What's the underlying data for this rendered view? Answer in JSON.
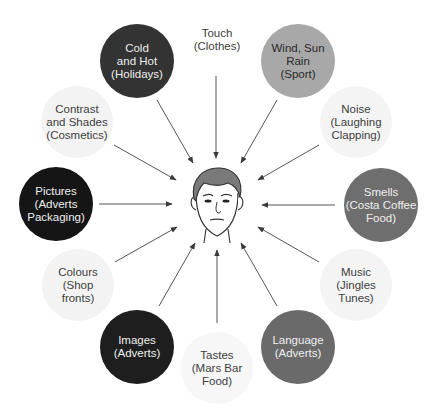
{
  "diagram": {
    "center": {
      "label": "Person (face)",
      "x": 217,
      "y": 203
    },
    "colors": {
      "dark": "#2f2f2f",
      "black": "#1a1a1a",
      "mid": "#6a6a6a",
      "light_mid": "#a8a8a8",
      "pale": "#f2f2f2",
      "text_dark_bg": "#f0f0f0",
      "text_light_bg": "#404040",
      "arrow": "#4a4a4a"
    },
    "nodes": [
      {
        "id": "touch",
        "label": "Touch\n(Clothes)",
        "cx": 217,
        "cy": 40,
        "r": 36,
        "fill": "#ffffff",
        "text": "#404040",
        "arrow": [
          216,
          73,
          216,
          158
        ]
      },
      {
        "id": "wind",
        "label": "Wind, Sun\nRain\n(Sport)",
        "cx": 298,
        "cy": 61,
        "r": 37,
        "fill": "#a8a8a8",
        "text": "#2a2a2a",
        "arrow": [
          277,
          100,
          241,
          163
        ]
      },
      {
        "id": "noise",
        "label": "Noise\n(Laughing\nClapping)",
        "cx": 356,
        "cy": 122,
        "r": 36,
        "fill": "#f4f4f4",
        "text": "#404040",
        "arrow": [
          319,
          145,
          258,
          180
        ]
      },
      {
        "id": "smells",
        "label": "Smells\n(Costa Coffee\nFood)",
        "cx": 381,
        "cy": 205,
        "r": 37,
        "fill": "#6e6e6e",
        "text": "#eeeeee",
        "arrow": [
          335,
          205,
          262,
          205
        ]
      },
      {
        "id": "music",
        "label": "Music\n(Jingles\nTunes)",
        "cx": 356,
        "cy": 285,
        "r": 36,
        "fill": "#f4f4f4",
        "text": "#404040",
        "arrow": [
          319,
          262,
          258,
          227
        ]
      },
      {
        "id": "language",
        "label": "Language\n(Adverts)",
        "cx": 298,
        "cy": 347,
        "r": 37,
        "fill": "#6a6a6a",
        "text": "#eeeeee",
        "arrow": [
          277,
          306,
          241,
          243
        ]
      },
      {
        "id": "tastes",
        "label": "Tastes\n(Mars Bar\nFood)",
        "cx": 217,
        "cy": 368,
        "r": 36,
        "fill": "#f7f7f7",
        "text": "#404040",
        "arrow": [
          217,
          323,
          217,
          250
        ]
      },
      {
        "id": "images",
        "label": "Images\n(Adverts)",
        "cx": 137,
        "cy": 347,
        "r": 37,
        "fill": "#1e1e1e",
        "text": "#eeeeee",
        "arrow": [
          159,
          306,
          195,
          243
        ]
      },
      {
        "id": "colours",
        "label": "Colours\n(Shop\nfronts)",
        "cx": 78,
        "cy": 285,
        "r": 36,
        "fill": "#f3f3f3",
        "text": "#404040",
        "arrow": [
          115,
          262,
          177,
          227
        ]
      },
      {
        "id": "pictures",
        "label": "Pictures\n(Adverts\nPackaging)",
        "cx": 56,
        "cy": 204,
        "r": 37,
        "fill": "#151515",
        "text": "#eeeeee",
        "arrow": [
          99,
          204,
          172,
          204
        ]
      },
      {
        "id": "contrast",
        "label": "Contrast\nand Shades\n(Cosmetics)",
        "cx": 77,
        "cy": 122,
        "r": 36,
        "fill": "#f3f3f3",
        "text": "#404040",
        "arrow": [
          114,
          145,
          176,
          180
        ]
      },
      {
        "id": "cold",
        "label": "Cold\nand Hot\n(Holidays)",
        "cx": 137,
        "cy": 61,
        "r": 37,
        "fill": "#333333",
        "text": "#eeeeee",
        "arrow": [
          157,
          100,
          193,
          163
        ]
      }
    ]
  }
}
